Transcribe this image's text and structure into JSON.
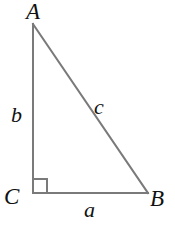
{
  "figure": {
    "kind": "right-triangle-diagram",
    "background_color": "#ffffff",
    "stroke_color": "#7a7a7a",
    "text_color": "#111111",
    "stroke_width": 2,
    "width": 175,
    "height": 230
  },
  "vertices": [
    {
      "id": "A",
      "label": "A",
      "x": 33,
      "y": 24,
      "label_x": 26,
      "label_y": 0
    },
    {
      "id": "B",
      "label": "B",
      "x": 148,
      "y": 193,
      "label_x": 150,
      "label_y": 187
    },
    {
      "id": "C",
      "label": "C",
      "x": 33,
      "y": 193,
      "label_x": 4,
      "label_y": 185
    }
  ],
  "sides": [
    {
      "id": "a",
      "label": "a",
      "from": "C",
      "to": "B",
      "role": "base-leg",
      "label_x": 84,
      "label_y": 199
    },
    {
      "id": "b",
      "label": "b",
      "from": "C",
      "to": "A",
      "role": "vertical-leg",
      "label_x": 11,
      "label_y": 104
    },
    {
      "id": "c",
      "label": "c",
      "from": "A",
      "to": "B",
      "role": "hypotenuse",
      "label_x": 94,
      "label_y": 96
    }
  ],
  "right_angle": {
    "at_vertex": "C",
    "marker": "square",
    "x": 33,
    "y": 179,
    "size": 14
  }
}
